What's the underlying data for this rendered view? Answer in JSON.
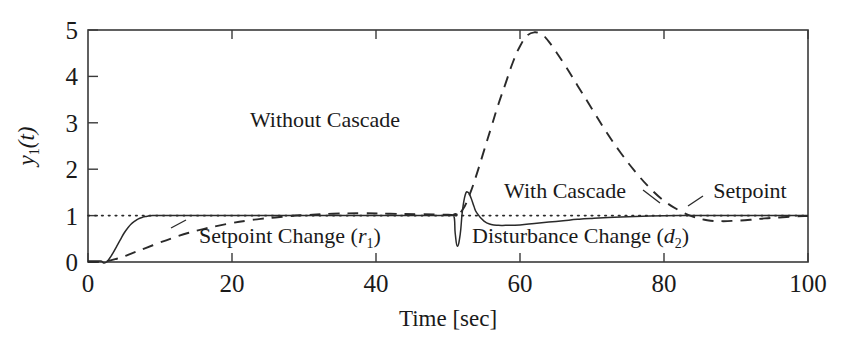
{
  "chart_data": {
    "type": "line",
    "title": "",
    "xlabel": "Time [sec]",
    "ylabel": "y1(t)",
    "ylabel_parts": {
      "base": "y",
      "sub": "1",
      "rest": "(t)"
    },
    "xlim": [
      0,
      100
    ],
    "ylim": [
      0,
      5
    ],
    "xticks": [
      0,
      20,
      40,
      60,
      80,
      100
    ],
    "yticks": [
      0,
      1,
      2,
      3,
      4,
      5
    ],
    "xticklabels": [
      "0",
      "20",
      "40",
      "60",
      "80",
      "100"
    ],
    "yticklabels": [
      "0",
      "1",
      "2",
      "3",
      "4",
      "5"
    ],
    "grid": false,
    "legend_position": "in-plot-annotations",
    "series": [
      {
        "name": "Without Cascade",
        "style": "dashed",
        "color": "#2a2a2a",
        "x": [
          0,
          1,
          2,
          3,
          4,
          5,
          6,
          8,
          10,
          12,
          14,
          16,
          18,
          20,
          22,
          24,
          26,
          28,
          30,
          34,
          38,
          42,
          46,
          50,
          51,
          52,
          53,
          54,
          55,
          56,
          57,
          58,
          59,
          60,
          61,
          62,
          63,
          64,
          66,
          68,
          70,
          72,
          74,
          76,
          78,
          80,
          82,
          84,
          86,
          88,
          90,
          92,
          94,
          96,
          98,
          100
        ],
        "y": [
          0,
          0.0,
          0.01,
          0.03,
          0.07,
          0.12,
          0.18,
          0.3,
          0.42,
          0.53,
          0.63,
          0.71,
          0.78,
          0.84,
          0.89,
          0.93,
          0.96,
          0.99,
          1.01,
          1.04,
          1.05,
          1.04,
          1.03,
          1.02,
          1.02,
          1.12,
          1.45,
          1.9,
          2.4,
          2.9,
          3.4,
          3.85,
          4.3,
          4.65,
          4.88,
          4.95,
          4.9,
          4.75,
          4.3,
          3.8,
          3.3,
          2.8,
          2.35,
          1.95,
          1.6,
          1.32,
          1.12,
          0.98,
          0.9,
          0.88,
          0.89,
          0.91,
          0.94,
          0.96,
          0.98,
          0.99
        ]
      },
      {
        "name": "With Cascade",
        "style": "solid",
        "color": "#2a2a2a",
        "x": [
          0,
          1,
          1.8,
          2.2,
          2.6,
          3,
          3.5,
          4,
          4.5,
          5,
          5.5,
          6,
          6.5,
          7,
          7.5,
          8,
          9,
          10,
          12,
          16,
          20,
          30,
          40,
          50,
          50.8,
          51,
          51.3,
          51.7,
          52,
          52.4,
          52.8,
          53.2,
          53.6,
          54,
          55,
          56,
          57,
          58,
          60,
          62,
          64,
          66,
          68,
          70,
          74,
          78,
          82,
          86,
          90,
          95,
          100
        ],
        "y": [
          0.02,
          0.02,
          0.02,
          -0.02,
          0.0,
          0.08,
          0.2,
          0.34,
          0.48,
          0.62,
          0.73,
          0.82,
          0.88,
          0.93,
          0.96,
          0.98,
          1.0,
          1.0,
          1.0,
          1.0,
          1.0,
          1.0,
          1.0,
          1.0,
          1.0,
          0.62,
          0.34,
          0.6,
          1.1,
          1.45,
          1.5,
          1.38,
          1.2,
          1.06,
          0.88,
          0.81,
          0.79,
          0.79,
          0.8,
          0.83,
          0.86,
          0.89,
          0.92,
          0.94,
          0.97,
          0.99,
          1.0,
          1.0,
          1.0,
          1.0,
          1.0
        ]
      },
      {
        "name": "Setpoint",
        "style": "dotted",
        "color": "#2a2a2a",
        "x": [
          0,
          100
        ],
        "y": [
          1,
          1
        ]
      }
    ],
    "annotations": [
      {
        "id": "without-cascade",
        "text": "Without Cascade",
        "x": 33,
        "y": 2.9
      },
      {
        "id": "with-cascade",
        "text": "With Cascade",
        "x": 57.5,
        "y": 1.42
      },
      {
        "id": "setpoint",
        "text": "Setpoint",
        "x": 81,
        "y": 1.42
      },
      {
        "id": "setpoint-change",
        "text": "Setpoint Change",
        "sub_open": " (",
        "sub_var": "r",
        "sub_idx": "1",
        "sub_close": ")",
        "x": 16.5,
        "y": 0.42
      },
      {
        "id": "disturbance-change",
        "text": "Disturbance Change",
        "sub_open": " (",
        "sub_var": "d",
        "sub_idx": "2",
        "sub_close": ")",
        "x": 53,
        "y": 0.42
      }
    ]
  },
  "figure": {
    "background_color": "#ffffff",
    "axis_color": "#3a3a3a",
    "line_color": "#2a2a2a"
  }
}
